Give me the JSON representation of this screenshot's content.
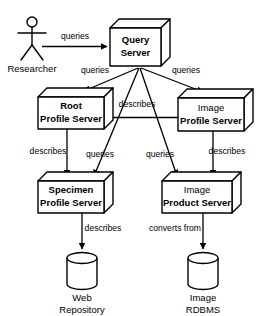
{
  "diagram": {
    "colors": {
      "stroke": "#000000",
      "fill": "#ffffff",
      "background": "#ffffff"
    },
    "actor": {
      "name": "actor-researcher",
      "label": "Researcher"
    },
    "nodes": [
      {
        "id": "query-server",
        "line1": "Query",
        "line2": "Server",
        "shape": "box3d"
      },
      {
        "id": "root-profile",
        "line1": "Root",
        "line2": "Profile Server",
        "shape": "box3d"
      },
      {
        "id": "image-profile",
        "line1": "Image",
        "line2": "Profile Server",
        "shape": "box3d"
      },
      {
        "id": "specimen-profile",
        "line1": "Specimen",
        "line2": "Profile Server",
        "shape": "box3d"
      },
      {
        "id": "image-product",
        "line1": "Image",
        "line2": "Product Server",
        "shape": "box3d"
      }
    ],
    "stores": [
      {
        "id": "web-repository",
        "line1": "Web",
        "line2": "Repository",
        "shape": "cylinder"
      },
      {
        "id": "image-rdbms",
        "line1": "Image",
        "line2": "RDBMS",
        "shape": "cylinder"
      }
    ],
    "edges": [
      {
        "id": "researcher-to-query",
        "label": "queries",
        "from": "actor-researcher",
        "to": "query-server"
      },
      {
        "id": "query-to-root",
        "label": "queries",
        "from": "query-server",
        "to": "root-profile"
      },
      {
        "id": "query-to-image-profile",
        "label": "queries",
        "from": "query-server",
        "to": "image-profile"
      },
      {
        "id": "query-to-specimen",
        "label": "queries",
        "from": "query-server",
        "to": "specimen-profile"
      },
      {
        "id": "query-to-image-product",
        "label": "queries",
        "from": "query-server",
        "to": "image-product"
      },
      {
        "id": "root-to-image-profile",
        "label": "describes",
        "from": "root-profile",
        "to": "image-profile"
      },
      {
        "id": "root-to-specimen",
        "label": "describes",
        "from": "root-profile",
        "to": "specimen-profile"
      },
      {
        "id": "image-profile-to-image-product",
        "label": "describes",
        "from": "image-profile",
        "to": "image-product"
      },
      {
        "id": "specimen-to-web-repository",
        "label": "describes",
        "from": "specimen-profile",
        "to": "web-repository"
      },
      {
        "id": "image-product-to-rdbms",
        "label": "converts from",
        "from": "image-product",
        "to": "image-rdbms"
      }
    ]
  }
}
